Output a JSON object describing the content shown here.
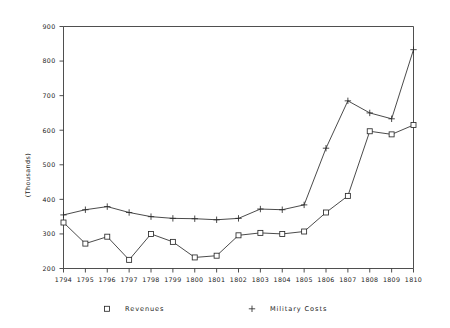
{
  "chart_data": {
    "type": "line",
    "title": "",
    "xlabel": "",
    "ylabel": "(Thousands)",
    "categories": [
      "1794",
      "1795",
      "1796",
      "1797",
      "1798",
      "1799",
      "1800",
      "1801",
      "1802",
      "1803",
      "1804",
      "1805",
      "1806",
      "1807",
      "1808",
      "1809",
      "1810"
    ],
    "xlim": [
      1794,
      1810
    ],
    "ylim": [
      200,
      900
    ],
    "yticks": [
      200,
      300,
      400,
      500,
      600,
      700,
      800,
      900
    ],
    "grid": false,
    "legend_position": "bottom",
    "series": [
      {
        "name": "Revenues",
        "marker": "square",
        "values": [
          333,
          272,
          292,
          225,
          300,
          277,
          232,
          237,
          296,
          303,
          300,
          307,
          362,
          410,
          597,
          588,
          615
        ]
      },
      {
        "name": "Military Costs",
        "marker": "plus",
        "values": [
          355,
          370,
          379,
          362,
          350,
          345,
          344,
          341,
          345,
          372,
          370,
          384,
          548,
          685,
          650,
          633,
          833
        ]
      }
    ]
  },
  "legend": {
    "entries": [
      {
        "label": "Revenues",
        "marker": "square"
      },
      {
        "label": "Military Costs",
        "marker": "plus"
      }
    ]
  },
  "axes": {
    "y_title": "(Thousands)"
  }
}
